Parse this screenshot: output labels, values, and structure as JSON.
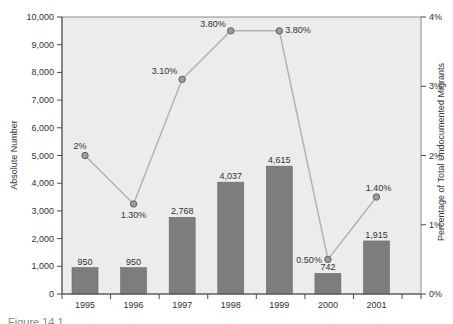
{
  "caption_fragment": "Figure 14.1",
  "colors": {
    "plot_bg": "#ececec",
    "bar": "#7d7d7d",
    "bar_edge": "#6a6a6a",
    "line": "#b2b2b2",
    "marker_fill": "#9c9c9c",
    "marker_stroke": "#5f5f5f",
    "axis": "#8c8c8c",
    "axis_dark": "#4a4a4a",
    "text": "#333333"
  },
  "chart_data": {
    "type": "bar+line",
    "title": "",
    "categories": [
      "1995",
      "1996",
      "1997",
      "1998",
      "1999",
      "2000",
      "2001"
    ],
    "grid": false,
    "legend": "none",
    "series": [
      {
        "name": "Absolute Number",
        "type": "bar",
        "axis": "left",
        "values": [
          950,
          950,
          2768,
          4037,
          4615,
          742,
          1915
        ],
        "labels": [
          "950",
          "950",
          "2,768",
          "4,037",
          "4,615",
          "742",
          "1,915"
        ]
      },
      {
        "name": "Percentage of Total Undocumented Migrants",
        "type": "line",
        "axis": "right",
        "values": [
          2.0,
          1.3,
          3.1,
          3.8,
          3.8,
          0.5,
          1.4
        ],
        "labels": [
          "2%",
          "1.30%",
          "3.10%",
          "3.80%",
          "3.80%",
          "0.50%",
          "1.40%"
        ]
      }
    ],
    "left_axis": {
      "label": "Absolute Number",
      "min": 0,
      "max": 10000,
      "ticks": [
        "0",
        "1,000",
        "2,000",
        "3,000",
        "4,000",
        "5,000",
        "6,000",
        "7,000",
        "8,000",
        "9,000",
        "10,000"
      ]
    },
    "right_axis": {
      "label": "Percentage of Total Undocumented Migrants",
      "min": 0,
      "max": 4,
      "ticks": [
        "0%",
        "1%",
        "2%",
        "3%",
        "4%"
      ]
    },
    "x_axis": {
      "label": "",
      "ticks": [
        "1995",
        "1996",
        "1997",
        "1998",
        "1999",
        "2000",
        "2001"
      ]
    }
  }
}
